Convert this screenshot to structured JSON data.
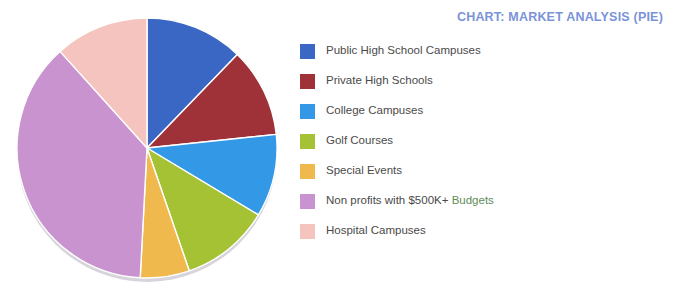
{
  "title": "CHART: MARKET ANALYSIS (PIE)",
  "title_color": "#7B93D8",
  "background_color": "#FFFFFF",
  "legend": {
    "position": "right",
    "items": [
      {
        "label": "Public High School Campuses",
        "color": "#3A66C4"
      },
      {
        "label": "Private High Schools",
        "color": "#9E3238"
      },
      {
        "label": "College Campuses",
        "color": "#3399E6"
      },
      {
        "label": "Golf Courses",
        "color": "#A5C234"
      },
      {
        "label": "Special Events",
        "color": "#F0B94E"
      },
      {
        "label": "Non profits with $500K+ Budgets",
        "color": "#C893CE",
        "label_prefix": "Non profits with $500K+ ",
        "label_accent": "Budgets"
      },
      {
        "label": "Hospital Campuses",
        "color": "#F6C4BE"
      }
    ]
  },
  "chart_data": {
    "type": "pie",
    "title": "CHART: MARKET ANALYSIS (PIE)",
    "xlabel": "",
    "ylabel": "",
    "legend_position": "right",
    "grid": false,
    "start_angle_deg": 0,
    "direction": "clockwise",
    "categories": [
      "Public High School Campuses",
      "Private High Schools",
      "College Campuses",
      "Golf Courses",
      "Special Events",
      "Non profits with $500K+ Budgets",
      "Hospital Campuses"
    ],
    "values": [
      12.2,
      11.1,
      10.3,
      11.1,
      6.1,
      37.5,
      11.7
    ],
    "angles_deg": [
      44,
      40,
      37,
      40,
      22,
      135,
      42
    ],
    "colors": [
      "#3A66C4",
      "#9E3238",
      "#3399E6",
      "#A5C234",
      "#F0B94E",
      "#C893CE",
      "#F6C4BE"
    ],
    "units": "percent"
  },
  "pie_geometry": {
    "cx": 134,
    "cy": 140,
    "r": 130,
    "rim_color": "#D8D4DC",
    "separator_color": "#FFFFFF"
  }
}
